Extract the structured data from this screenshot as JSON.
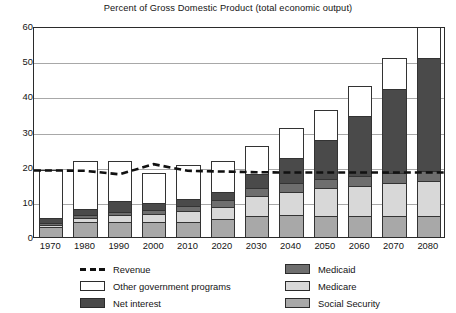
{
  "chart_data": {
    "type": "bar",
    "stacked": true,
    "title": "Percent of Gross Domestic Product (total economic output)",
    "xlabel": "",
    "ylabel": "",
    "ylim": [
      0,
      60
    ],
    "ytick_step": 10,
    "yticks": [
      0,
      10,
      20,
      30,
      40,
      50,
      60
    ],
    "grid": true,
    "legend_position": "bottom",
    "categories": [
      "1970",
      "1980",
      "1990",
      "2000",
      "2010",
      "2020",
      "2030",
      "2040",
      "2050",
      "2060",
      "2070",
      "2080"
    ],
    "series": [
      {
        "name": "Social Security",
        "color": "#a8a8a8",
        "values": [
          2.9,
          4.3,
          4.3,
          4.2,
          4.2,
          5.0,
          6.1,
          6.2,
          6.1,
          5.9,
          6.0,
          6.0
        ]
      },
      {
        "name": "Medicare",
        "color": "#d8d8d8",
        "values": [
          0.6,
          1.1,
          1.9,
          2.2,
          3.1,
          3.5,
          5.5,
          6.6,
          7.7,
          8.6,
          9.3,
          9.8
        ]
      },
      {
        "name": "Medicaid",
        "color": "#6e6e6e",
        "values": [
          0.4,
          0.8,
          0.9,
          1.2,
          1.6,
          1.9,
          2.4,
          2.5,
          2.6,
          2.8,
          2.9,
          3.0
        ]
      },
      {
        "name": "Net interest",
        "color": "#4a4a4a",
        "values": [
          1.4,
          1.8,
          3.0,
          2.2,
          1.8,
          2.5,
          4.0,
          7.3,
          11.3,
          17.0,
          23.8,
          32.2
        ]
      },
      {
        "name": "Other government programs",
        "color": "#ffffff",
        "values": [
          13.7,
          13.7,
          11.6,
          8.5,
          9.8,
          8.7,
          8.0,
          8.4,
          8.5,
          8.5,
          8.8,
          9.0
        ]
      }
    ],
    "totals": [
      19.0,
      21.7,
      21.7,
      18.3,
      20.5,
      21.6,
      26.0,
      31.0,
      36.2,
      42.8,
      50.8,
      60.0
    ],
    "overlay_line": {
      "name": "Revenue",
      "style": "dashed",
      "color": "#111111",
      "values": [
        19.1,
        19.0,
        18.0,
        20.9,
        19.0,
        18.8,
        18.6,
        18.5,
        18.5,
        18.5,
        18.5,
        18.5
      ]
    },
    "note_2080_clipped": "2080 bar extends to the top of the plot area (60)"
  },
  "legend": {
    "left_column": [
      {
        "label": "Revenue",
        "swatch": "dashed-line"
      },
      {
        "label": "Other government programs",
        "swatch": "white-box"
      },
      {
        "label": "Net interest",
        "swatch": "darkest-gray-box"
      }
    ],
    "right_column": [
      {
        "label": "Medicaid",
        "swatch": "dark-gray-box"
      },
      {
        "label": "Medicare",
        "swatch": "light-gray-box"
      },
      {
        "label": "Social Security",
        "swatch": "medium-gray-box"
      }
    ]
  }
}
